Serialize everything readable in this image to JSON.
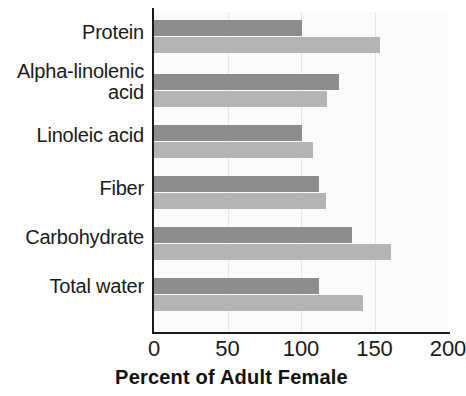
{
  "chart_data": {
    "type": "bar",
    "orientation": "horizontal",
    "title": "",
    "xlabel": "Percent of Adult Female",
    "ylabel": "",
    "xlim": [
      0,
      200
    ],
    "xticks": [
      0,
      50,
      100,
      150,
      200
    ],
    "xtick_labels": [
      "0",
      "50",
      "100",
      "150",
      "200"
    ],
    "grid": true,
    "legend": "none",
    "categories": [
      "Protein",
      "Alpha-linolenic\nacid",
      "Linoleic acid",
      "Fiber",
      "Carbohydrate",
      "Total water"
    ],
    "series": [
      {
        "name": "upper-bar",
        "color": "#8d8d8d",
        "values": [
          101,
          126,
          101,
          112,
          135,
          112
        ]
      },
      {
        "name": "lower-bar",
        "color": "#b4b4b4",
        "values": [
          154,
          118,
          108,
          117,
          161,
          142
        ]
      }
    ]
  },
  "colors": {
    "series_dark": "#8d8d8d",
    "series_light": "#b4b4b4",
    "axis": "#1b1b1b",
    "gridline": "#e6e6e6",
    "plot_background": "#fbfbfb",
    "text": "#1a1a1a"
  }
}
